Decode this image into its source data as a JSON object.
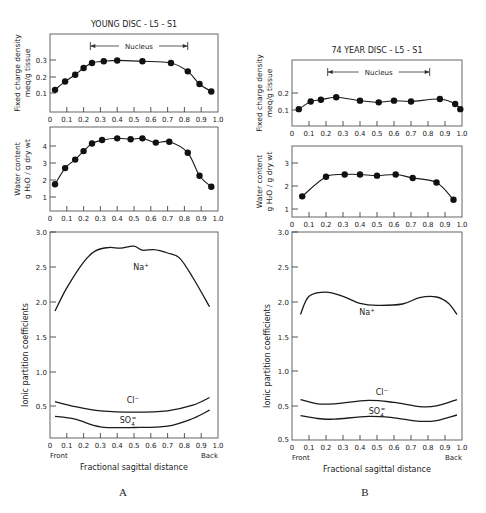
{
  "figure": {
    "panel_labels": [
      "A",
      "B"
    ]
  },
  "chart_data": [
    {
      "panel": "A",
      "title": "YOUNG DISC - L5 - S1",
      "type": "line",
      "subplot": "fixed_charge_density",
      "ylabel": "Fixed charge density meq/g tissue",
      "xlabel": "",
      "xlim": [
        0,
        1.0
      ],
      "ylim": [
        0,
        0.38
      ],
      "yticks": [
        "0.1",
        "0.2",
        "0.3"
      ],
      "xticks": [
        "0",
        "0.1",
        "0.2",
        "0.3",
        "0.4",
        "0.5",
        "0.6",
        "0.7",
        "0.8",
        "0.9",
        "1.0"
      ],
      "annotation": {
        "text": "Nucleus",
        "from": 0.24,
        "to": 0.82
      },
      "x": [
        0.03,
        0.09,
        0.15,
        0.2,
        0.25,
        0.32,
        0.4,
        0.55,
        0.72,
        0.82,
        0.89,
        0.96
      ],
      "values": [
        0.12,
        0.17,
        0.21,
        0.25,
        0.28,
        0.29,
        0.295,
        0.29,
        0.28,
        0.23,
        0.155,
        0.11
      ]
    },
    {
      "panel": "A",
      "type": "line",
      "subplot": "water_content",
      "ylabel": "Water content g H2O / g dry wt",
      "xlim": [
        0,
        1.0
      ],
      "ylim": [
        0,
        4.9
      ],
      "yticks": [
        "1",
        "2",
        "3",
        "4"
      ],
      "xticks": [
        "0",
        "0.1",
        "0.2",
        "0.3",
        "0.4",
        "0.5",
        "0.6",
        "0.7",
        "0.8",
        "0.9",
        "1.0"
      ],
      "x": [
        0.03,
        0.09,
        0.15,
        0.2,
        0.25,
        0.31,
        0.4,
        0.48,
        0.55,
        0.63,
        0.71,
        0.82,
        0.89,
        0.96
      ],
      "values": [
        1.75,
        2.7,
        3.2,
        3.7,
        4.15,
        4.35,
        4.45,
        4.4,
        4.45,
        4.2,
        4.25,
        3.6,
        2.25,
        1.6
      ]
    },
    {
      "panel": "A",
      "type": "line",
      "subplot": "ionic_partition_coefficients",
      "ylabel": "Ionic partition coefficients",
      "xlabel": "Fractional sagittal distance",
      "x_end_labels": {
        "left": "Front",
        "right": "Back"
      },
      "xlim": [
        0,
        1.0
      ],
      "ylim": [
        0.05,
        3.0
      ],
      "yticks": [
        "0.5",
        "1.0",
        "1.5",
        "2.0",
        "2.5",
        "3.0"
      ],
      "xticks": [
        "0",
        "0.1",
        "0.2",
        "0.3",
        "0.4",
        "0.5",
        "0.6",
        "0.7",
        "0.8",
        "0.9",
        "1.0"
      ],
      "series": [
        {
          "name": "Na+",
          "x": [
            0.03,
            0.1,
            0.2,
            0.27,
            0.35,
            0.42,
            0.5,
            0.55,
            0.62,
            0.7,
            0.77,
            0.85,
            0.95
          ],
          "values": [
            1.87,
            2.2,
            2.57,
            2.73,
            2.78,
            2.77,
            2.8,
            2.74,
            2.75,
            2.7,
            2.63,
            2.35,
            1.93
          ]
        },
        {
          "name": "Cl-",
          "x": [
            0.03,
            0.15,
            0.3,
            0.5,
            0.7,
            0.85,
            0.95
          ],
          "values": [
            0.57,
            0.5,
            0.44,
            0.42,
            0.44,
            0.52,
            0.63
          ]
        },
        {
          "name": "SO4=",
          "x": [
            0.03,
            0.15,
            0.3,
            0.5,
            0.7,
            0.85,
            0.95
          ],
          "values": [
            0.36,
            0.32,
            0.21,
            0.2,
            0.22,
            0.33,
            0.45
          ]
        }
      ]
    },
    {
      "panel": "B",
      "title": "74 YEAR DISC - L5 - S1",
      "type": "line",
      "subplot": "fixed_charge_density",
      "ylabel": "Fixed charge density meq/g tissue",
      "xlim": [
        0,
        1.0
      ],
      "ylim": [
        0,
        0.39
      ],
      "yticks": [
        "0.1",
        "0.2"
      ],
      "xticks": [
        "0",
        "0.1",
        "0.2",
        "0.3",
        "0.4",
        "0.5",
        "0.6",
        "0.7",
        "0.8",
        "0.9",
        "1.0"
      ],
      "annotation": {
        "text": "Nucleus",
        "from": 0.21,
        "to": 0.81
      },
      "x": [
        0.04,
        0.11,
        0.17,
        0.26,
        0.4,
        0.51,
        0.6,
        0.7,
        0.87,
        0.96,
        0.99
      ],
      "values": [
        0.105,
        0.15,
        0.16,
        0.175,
        0.155,
        0.145,
        0.155,
        0.15,
        0.165,
        0.135,
        0.105
      ]
    },
    {
      "panel": "B",
      "type": "line",
      "subplot": "water_content",
      "ylabel": "Water content g H2O / g dry wt",
      "xlim": [
        0,
        1.0
      ],
      "ylim": [
        0,
        3.75
      ],
      "yticks": [
        "1",
        "2",
        "3"
      ],
      "xticks": [
        "0",
        "0.1",
        "0.2",
        "0.3",
        "0.4",
        "0.5",
        "0.6",
        "0.7",
        "0.8",
        "0.9",
        "1.0"
      ],
      "x": [
        0.06,
        0.2,
        0.31,
        0.4,
        0.5,
        0.61,
        0.71,
        0.85,
        0.95
      ],
      "values": [
        1.55,
        2.4,
        2.5,
        2.5,
        2.45,
        2.5,
        2.35,
        2.15,
        1.4
      ]
    },
    {
      "panel": "B",
      "type": "line",
      "subplot": "ionic_partition_coefficients",
      "ylabel": "Ionic partition coefficients",
      "xlabel": "Fractional sagittal distance",
      "x_end_labels": {
        "left": "Front",
        "right": "Back"
      },
      "xlim": [
        0,
        1.0
      ],
      "ylim": [
        0.05,
        3.0
      ],
      "yticks": [
        "0.5",
        "0.5",
        "1.0",
        "1.5",
        "2.0",
        "2.5",
        "3.0"
      ],
      "xticks": [
        "0",
        "0.1",
        "0.2",
        "0.3",
        "0.4",
        "0.5",
        "0.6",
        "0.7",
        "0.8",
        "0.9",
        "1.0"
      ],
      "series": [
        {
          "name": "Na+",
          "x": [
            0.05,
            0.1,
            0.2,
            0.3,
            0.4,
            0.5,
            0.65,
            0.75,
            0.85,
            0.92,
            0.97
          ],
          "values": [
            1.82,
            2.08,
            2.14,
            2.08,
            1.98,
            1.95,
            1.97,
            2.06,
            2.07,
            1.98,
            1.82
          ]
        },
        {
          "name": "Cl-",
          "x": [
            0.05,
            0.15,
            0.25,
            0.45,
            0.6,
            0.75,
            0.85,
            0.97
          ],
          "values": [
            0.6,
            0.54,
            0.54,
            0.59,
            0.56,
            0.5,
            0.51,
            0.6
          ]
        },
        {
          "name": "SO4=",
          "x": [
            0.05,
            0.15,
            0.25,
            0.45,
            0.6,
            0.75,
            0.85,
            0.97
          ],
          "values": [
            0.37,
            0.33,
            0.32,
            0.36,
            0.34,
            0.29,
            0.3,
            0.38
          ]
        }
      ]
    }
  ]
}
